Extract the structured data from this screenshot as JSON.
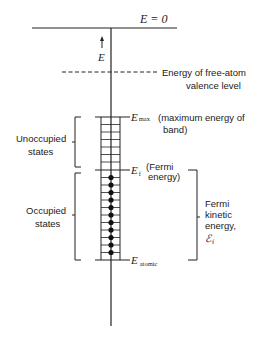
{
  "diagram": {
    "type": "energy-level diagram (band of states in a metal)",
    "colors": {
      "ink": "#222222",
      "background": "#ffffff"
    },
    "top_level": {
      "label": "E = 0"
    },
    "axis_arrow": {
      "label": "E",
      "direction": "up"
    },
    "free_atom_level": {
      "style": "dashed",
      "label_line1": "Energy of free-atom",
      "label_line2": "valence level"
    },
    "band": {
      "unoccupied_rung_count": 8,
      "occupied_rung_count": 11,
      "occupied_marker": "filled-dot",
      "top_label": {
        "symbol": "E",
        "subscript": "max",
        "desc_line1": "(maximum energy of",
        "desc_line2": "band)"
      },
      "fermi_label": {
        "symbol": "E",
        "subscript": "f",
        "desc_line1": "(Fermi",
        "desc_line2": "energy)"
      },
      "bottom_label": {
        "symbol": "E",
        "subscript": "atomic"
      }
    },
    "left_brackets": [
      {
        "label_line1": "Unoccupied",
        "label_line2": "states"
      },
      {
        "label_line1": "Occupied",
        "label_line2": "states"
      }
    ],
    "right_bracket": {
      "label_line1": "Fermi",
      "label_line2": "kinetic",
      "label_line3": "energy,",
      "symbol": "ℰ",
      "subscript": "f"
    }
  }
}
